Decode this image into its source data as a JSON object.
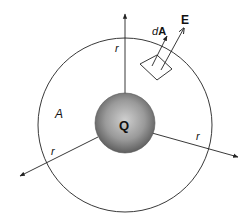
{
  "diagram": {
    "colors": {
      "stroke": "#222222",
      "sphere_light": "#c8c8c8",
      "sphere_dark": "#6a6a6a",
      "background": "#ffffff"
    },
    "labels": {
      "charge": "Q",
      "surface_area": "A",
      "radius_top": "r",
      "radius_left": "r",
      "radius_right": "r",
      "area_element_prefix": "d",
      "area_element_vector": "A",
      "field_vector": "E"
    }
  }
}
